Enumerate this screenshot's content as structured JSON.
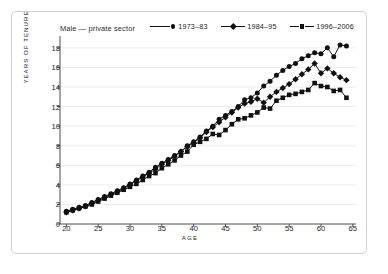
{
  "figure": {
    "caption": "Male — private sector",
    "frame_color": "#cfcfcf",
    "background": "#ffffff"
  },
  "legend": {
    "position": "top-right",
    "entries": [
      {
        "label": "1973–83",
        "marker": "circle",
        "color": "#111111"
      },
      {
        "label": "1984–95",
        "marker": "diamond",
        "color": "#111111"
      },
      {
        "label": "1996–2006",
        "marker": "square",
        "color": "#111111"
      }
    ]
  },
  "axes": {
    "xlabel": "AGE",
    "ylabel": "YEARS OF TENURE",
    "xlim": [
      19,
      65.5
    ],
    "ylim": [
      0,
      18.6
    ],
    "xticks": [
      20,
      25,
      30,
      35,
      40,
      45,
      50,
      55,
      60,
      65
    ],
    "yticks": [
      0,
      2,
      4,
      6,
      8,
      10,
      12,
      14,
      16,
      18
    ],
    "grid": "horizontal",
    "grid_color": "#ececec"
  },
  "chart_data": {
    "type": "line",
    "title": "Male — private sector",
    "xlabel": "AGE",
    "ylabel": "YEARS OF TENURE",
    "xlim": [
      19,
      65.5
    ],
    "ylim": [
      0,
      18.6
    ],
    "grid": true,
    "legend_position": "top-right",
    "x": [
      20,
      21,
      22,
      23,
      24,
      25,
      26,
      27,
      28,
      29,
      30,
      31,
      32,
      33,
      34,
      35,
      36,
      37,
      38,
      39,
      40,
      41,
      42,
      43,
      44,
      45,
      46,
      47,
      48,
      49,
      50,
      51,
      52,
      53,
      54,
      55,
      56,
      57,
      58,
      59,
      60,
      61,
      62,
      63,
      64
    ],
    "series": [
      {
        "name": "1973–83",
        "marker": "circle",
        "color": "#111111",
        "values": [
          1.3,
          1.5,
          1.7,
          1.9,
          2.2,
          2.5,
          2.8,
          3.1,
          3.4,
          3.7,
          4.1,
          4.5,
          4.9,
          5.3,
          5.8,
          6.2,
          6.6,
          7.0,
          7.4,
          8.0,
          8.4,
          8.9,
          9.5,
          10.0,
          10.7,
          11.1,
          11.5,
          12.0,
          12.7,
          12.9,
          13.4,
          14.1,
          14.6,
          15.2,
          15.7,
          16.1,
          16.4,
          16.9,
          17.2,
          17.5,
          17.4,
          18.0,
          17.1,
          18.3,
          18.2
        ]
      },
      {
        "name": "1984–95",
        "marker": "diamond",
        "color": "#111111",
        "values": [
          1.2,
          1.4,
          1.6,
          1.8,
          2.1,
          2.4,
          2.7,
          3.0,
          3.3,
          3.6,
          4.0,
          4.4,
          4.8,
          5.2,
          5.6,
          6.1,
          6.5,
          6.9,
          7.4,
          7.9,
          8.3,
          8.8,
          9.4,
          9.9,
          10.4,
          10.9,
          11.4,
          11.9,
          12.3,
          12.5,
          12.8,
          12.4,
          13.0,
          13.5,
          13.9,
          14.3,
          14.8,
          15.3,
          15.8,
          16.4,
          15.4,
          15.9,
          15.4,
          15.0,
          14.7
        ]
      },
      {
        "name": "1996–2006",
        "marker": "square",
        "color": "#111111",
        "values": [
          1.2,
          1.4,
          1.6,
          1.8,
          2.0,
          2.3,
          2.6,
          2.9,
          3.2,
          3.5,
          3.8,
          4.1,
          4.5,
          4.9,
          5.2,
          5.7,
          6.1,
          6.5,
          7.0,
          7.4,
          8.1,
          8.4,
          8.7,
          9.2,
          9.1,
          9.6,
          10.2,
          10.7,
          10.8,
          11.1,
          11.4,
          11.9,
          11.8,
          12.6,
          12.9,
          13.2,
          13.3,
          13.5,
          13.7,
          14.4,
          14.1,
          14.0,
          13.6,
          13.7,
          12.9
        ]
      }
    ]
  }
}
